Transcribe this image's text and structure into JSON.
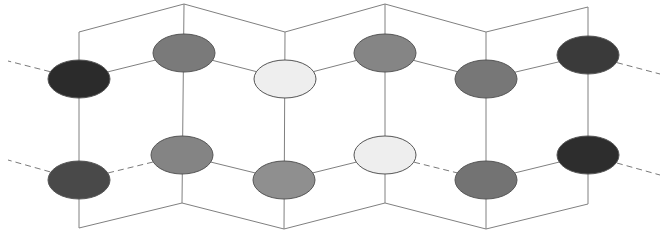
{
  "figure": {
    "background_color": "#ffffff",
    "width": 667,
    "height": 235
  },
  "chart_data": {
    "type": "diagram",
    "title": "",
    "xlabel": "",
    "ylabel": "",
    "grid": false,
    "legend": "none",
    "xlim": [
      0,
      667
    ],
    "ylim": [
      0,
      235
    ],
    "style": {
      "solid_line_color": "#808080",
      "solid_line_width": 1,
      "dashed_line_color": "#7a7a7a",
      "dashed_line_width": 1,
      "dash_pattern": "6 4",
      "node_outline_color": "#555555",
      "node_outline_width": 1,
      "node_rx": 31,
      "node_ry": 19
    },
    "rows": [
      {
        "name": "upper-row",
        "index": 0
      },
      {
        "name": "lower-row",
        "index": 1
      }
    ],
    "nodes": [
      {
        "id": "n1",
        "label": "node-1",
        "row": 0,
        "column": 0,
        "cx": 79,
        "cy": 79,
        "rx": 31,
        "ry": 19,
        "fill": "#2b2b2b",
        "shade": "very-dark"
      },
      {
        "id": "n2",
        "label": "node-2",
        "row": 0,
        "column": 1,
        "cx": 184,
        "cy": 53,
        "rx": 31,
        "ry": 19,
        "fill": "#7a7a7a",
        "shade": "medium"
      },
      {
        "id": "n3",
        "label": "node-3",
        "row": 0,
        "column": 2,
        "cx": 285,
        "cy": 79,
        "rx": 31,
        "ry": 19,
        "fill": "#eeeeee",
        "shade": "very-light"
      },
      {
        "id": "n4",
        "label": "node-4",
        "row": 0,
        "column": 3,
        "cx": 385,
        "cy": 53,
        "rx": 31,
        "ry": 19,
        "fill": "#858585",
        "shade": "medium"
      },
      {
        "id": "n5",
        "label": "node-5",
        "row": 0,
        "column": 4,
        "cx": 486,
        "cy": 79,
        "rx": 31,
        "ry": 19,
        "fill": "#777777",
        "shade": "medium"
      },
      {
        "id": "n6",
        "label": "node-6",
        "row": 0,
        "column": 5,
        "cx": 588,
        "cy": 55,
        "rx": 31,
        "ry": 19,
        "fill": "#3a3a3a",
        "shade": "dark"
      },
      {
        "id": "n7",
        "label": "node-7",
        "row": 1,
        "column": 0,
        "cx": 79,
        "cy": 180,
        "rx": 31,
        "ry": 19,
        "fill": "#494949",
        "shade": "dark"
      },
      {
        "id": "n8",
        "label": "node-8",
        "row": 1,
        "column": 1,
        "cx": 182,
        "cy": 155,
        "rx": 31,
        "ry": 19,
        "fill": "#848484",
        "shade": "medium"
      },
      {
        "id": "n9",
        "label": "node-9",
        "row": 1,
        "column": 2,
        "cx": 284,
        "cy": 180,
        "rx": 31,
        "ry": 19,
        "fill": "#8f8f8f",
        "shade": "medium-light"
      },
      {
        "id": "n10",
        "label": "node-10",
        "row": 1,
        "column": 3,
        "cx": 385,
        "cy": 155,
        "rx": 31,
        "ry": 19,
        "fill": "#eeeeee",
        "shade": "very-light"
      },
      {
        "id": "n11",
        "label": "node-11",
        "row": 1,
        "column": 4,
        "cx": 486,
        "cy": 180,
        "rx": 31,
        "ry": 19,
        "fill": "#737373",
        "shade": "medium"
      },
      {
        "id": "n12",
        "label": "node-12",
        "row": 1,
        "column": 5,
        "cx": 588,
        "cy": 155,
        "rx": 31,
        "ry": 19,
        "fill": "#2d2d2d",
        "shade": "very-dark"
      }
    ],
    "bonds_solid": [
      {
        "name": "bond-upper-1-2",
        "x1": 79,
        "y1": 79,
        "x2": 184,
        "y2": 53
      },
      {
        "name": "bond-upper-2-3",
        "x1": 184,
        "y1": 53,
        "x2": 285,
        "y2": 79
      },
      {
        "name": "bond-upper-3-4",
        "x1": 285,
        "y1": 79,
        "x2": 385,
        "y2": 53
      },
      {
        "name": "bond-upper-4-5",
        "x1": 385,
        "y1": 53,
        "x2": 486,
        "y2": 79
      },
      {
        "name": "bond-upper-5-6",
        "x1": 486,
        "y1": 79,
        "x2": 588,
        "y2": 55
      },
      {
        "name": "bond-lower-8-9",
        "x1": 182,
        "y1": 155,
        "x2": 284,
        "y2": 180
      },
      {
        "name": "bond-lower-9-10",
        "x1": 284,
        "y1": 180,
        "x2": 385,
        "y2": 155
      },
      {
        "name": "bond-lower-11-12",
        "x1": 486,
        "y1": 180,
        "x2": 588,
        "y2": 155
      },
      {
        "name": "rail-top-1-2",
        "x1": 79,
        "y1": 32,
        "x2": 184,
        "y2": 4
      },
      {
        "name": "rail-top-2-3",
        "x1": 184,
        "y1": 4,
        "x2": 285,
        "y2": 32
      },
      {
        "name": "rail-top-3-4",
        "x1": 285,
        "y1": 32,
        "x2": 385,
        "y2": 4
      },
      {
        "name": "rail-top-4-5",
        "x1": 385,
        "y1": 4,
        "x2": 486,
        "y2": 32
      },
      {
        "name": "rail-top-5-6",
        "x1": 486,
        "y1": 32,
        "x2": 588,
        "y2": 7
      },
      {
        "name": "rail-bottom-1-2",
        "x1": 79,
        "y1": 228,
        "x2": 182,
        "y2": 203
      },
      {
        "name": "rail-bottom-2-3",
        "x1": 182,
        "y1": 203,
        "x2": 284,
        "y2": 229
      },
      {
        "name": "rail-bottom-3-4",
        "x1": 284,
        "y1": 229,
        "x2": 385,
        "y2": 203
      },
      {
        "name": "rail-bottom-4-5",
        "x1": 385,
        "y1": 203,
        "x2": 486,
        "y2": 229
      },
      {
        "name": "rail-bottom-5-6",
        "x1": 486,
        "y1": 229,
        "x2": 588,
        "y2": 204
      },
      {
        "name": "strut-col-1",
        "x1": 79,
        "y1": 32,
        "x2": 79,
        "y2": 228
      },
      {
        "name": "strut-col-2",
        "x1": 184,
        "y1": 4,
        "x2": 182,
        "y2": 203
      },
      {
        "name": "strut-col-3",
        "x1": 285,
        "y1": 32,
        "x2": 284,
        "y2": 229
      },
      {
        "name": "strut-col-4",
        "x1": 385,
        "y1": 4,
        "x2": 385,
        "y2": 203
      },
      {
        "name": "strut-col-5",
        "x1": 486,
        "y1": 32,
        "x2": 486,
        "y2": 229
      },
      {
        "name": "strut-col-6",
        "x1": 588,
        "y1": 7,
        "x2": 588,
        "y2": 204
      }
    ],
    "bonds_dashed": [
      {
        "name": "dashed-left-upper",
        "x1": 79,
        "y1": 79,
        "x2": 8,
        "y2": 61
      },
      {
        "name": "dashed-left-lower",
        "x1": 79,
        "y1": 180,
        "x2": 8,
        "y2": 160
      },
      {
        "name": "dashed-right-upper",
        "x1": 588,
        "y1": 55,
        "x2": 660,
        "y2": 74
      },
      {
        "name": "dashed-right-lower",
        "x1": 588,
        "y1": 155,
        "x2": 660,
        "y2": 175
      },
      {
        "name": "dashed-lower-7-8",
        "x1": 79,
        "y1": 180,
        "x2": 182,
        "y2": 155
      },
      {
        "name": "dashed-lower-10-11",
        "x1": 385,
        "y1": 155,
        "x2": 486,
        "y2": 180
      }
    ]
  }
}
